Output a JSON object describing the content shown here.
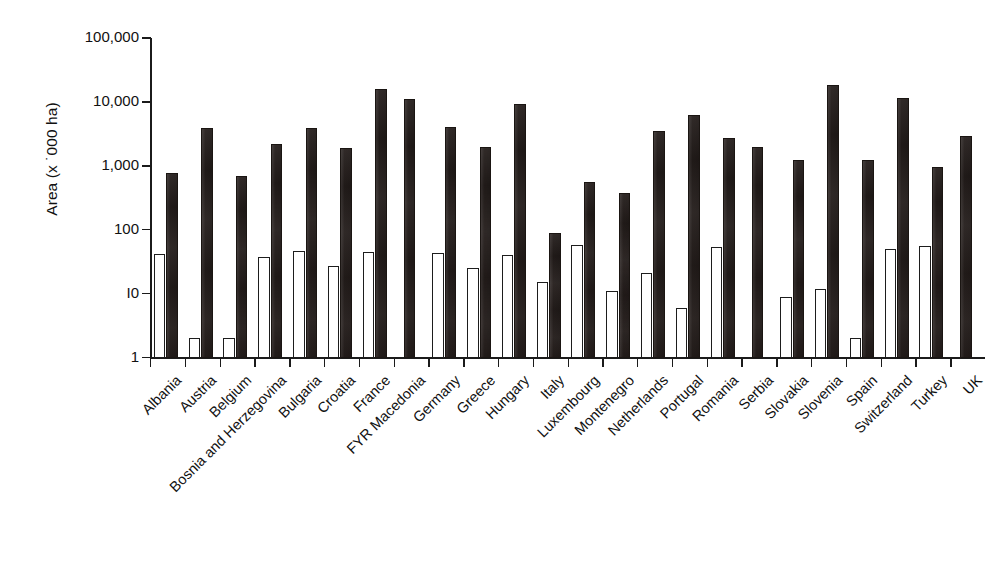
{
  "chart_data": {
    "type": "bar",
    "title": "",
    "subtitle": "",
    "xlabel": "",
    "ylabel": "Area (x ˙000 ha)",
    "yscale": "log",
    "ylim": [
      1,
      100000
    ],
    "ytick_labels": [
      "100,000",
      "10,000",
      "1,000",
      "100",
      "I0",
      "1"
    ],
    "ytick_values": [
      100000,
      10000,
      1000,
      100,
      10,
      1
    ],
    "grid": false,
    "legend_position": "none",
    "categories": [
      "Albania",
      "Austria",
      "Belgium",
      "Bosnia and Herzegovina",
      "Bulgaria",
      "Croatia",
      "France",
      "FYR Macedonia",
      "Germany",
      "Greece",
      "Hungary",
      "Italy",
      "Luxembourg",
      "Montenegro",
      "Netherlands",
      "Portugal",
      "Romania",
      "Serbia",
      "Slovakia",
      "Slovenia",
      "Spain",
      "Switzerland",
      "Turkey",
      "UK"
    ],
    "series": [
      {
        "name": "light-series",
        "color": "#ffffff",
        "values": [
          42,
          2,
          2,
          37,
          47,
          27,
          45,
          null,
          43,
          25,
          40,
          15,
          57,
          11,
          21,
          6,
          54,
          null,
          9,
          12,
          2,
          50,
          56,
          null
        ]
      },
      {
        "name": "dark-series",
        "color": "#241d1b",
        "values": [
          780,
          3900,
          690,
          2200,
          3900,
          1900,
          16000,
          11000,
          4000,
          2000,
          9200,
          90,
          560,
          370,
          3500,
          6200,
          2700,
          1950,
          1250,
          18500,
          1250,
          11500,
          950,
          2900
        ]
      }
    ]
  },
  "axis": {
    "y_title": "Area (x ˙000 ha)"
  }
}
